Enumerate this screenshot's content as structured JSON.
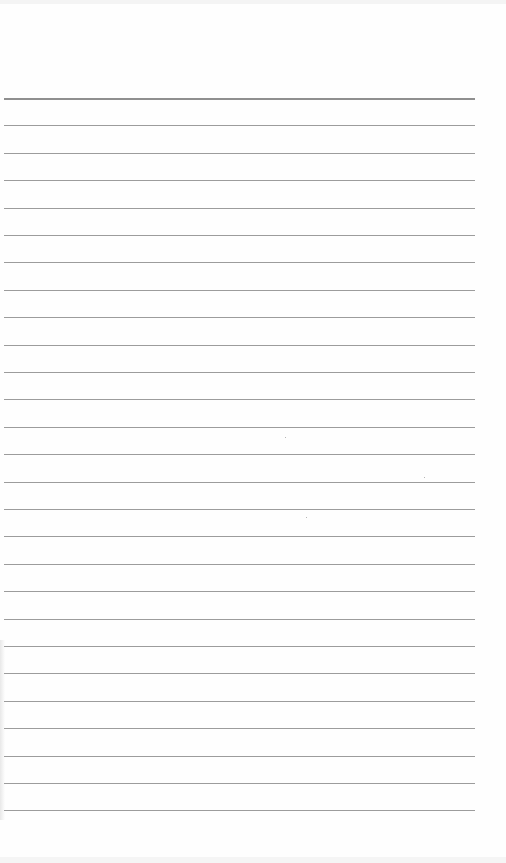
{
  "page": {
    "type": "lined notebook page",
    "background_color": "#fefefe",
    "rule_color": "#9c9c9c",
    "header_rule_color": "#8f8f8f",
    "rule_count": 27,
    "first_rule_y": 98,
    "rule_spacing": 27.4,
    "rule_left_x": 4,
    "rule_right_x": 475,
    "text_content": []
  }
}
